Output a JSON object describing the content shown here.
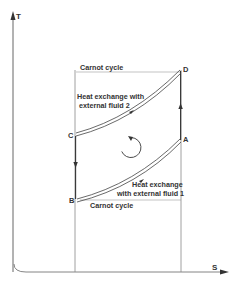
{
  "diagram": {
    "type": "T-S diagram",
    "axes": {
      "y_label": "T",
      "x_label": "S"
    },
    "points": {
      "A": "A",
      "B": "B",
      "C": "C",
      "D": "D"
    },
    "labels": {
      "top_reference": "Carnot cycle",
      "bottom_reference": "Carnot cycle",
      "upper_curve_line1": "Heat exchange with",
      "upper_curve_line2": "external fluid 2",
      "lower_curve_line1": "Heat exchange",
      "lower_curve_line2": "with external fluid 1"
    },
    "cycle_direction": "clockwise-arrow",
    "colors": {
      "line": "#444444",
      "text": "#333333",
      "reference_line": "#aaaaaa"
    }
  }
}
